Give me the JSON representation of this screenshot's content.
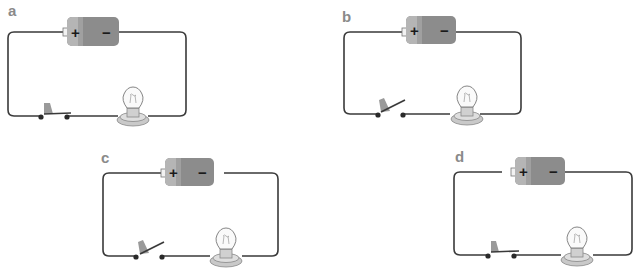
{
  "figure": {
    "type": "circuit-diagrams",
    "panels": [
      {
        "label": "a",
        "switch": "closed",
        "wire_gap": "none"
      },
      {
        "label": "b",
        "switch": "open",
        "wire_gap": "none"
      },
      {
        "label": "c",
        "switch": "open",
        "wire_gap": "negative-terminal"
      },
      {
        "label": "d",
        "switch": "closed",
        "wire_gap": "positive-terminal"
      }
    ],
    "battery": {
      "positive_symbol": "+",
      "negative_symbol": "−"
    },
    "colors": {
      "wire": "#3a3a3a",
      "battery_body": "#8c8c8c",
      "battery_cap": "#b5b5b5",
      "label": "#8a8a8a",
      "bulb_base": "#c9c9c9"
    }
  }
}
